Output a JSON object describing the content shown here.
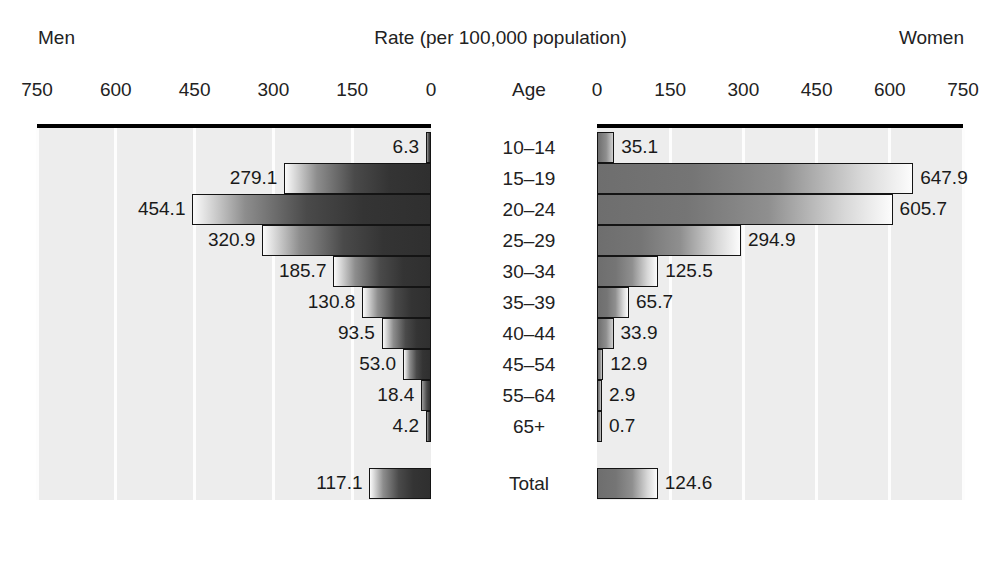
{
  "header": {
    "left_label": "Men",
    "title": "Rate (per 100,000 population)",
    "right_label": "Women",
    "age_column_header": "Age"
  },
  "chart_data": {
    "type": "bar",
    "title": "Rate (per 100,000 population)",
    "subtype": "population-pyramid",
    "xlabel": "Rate (per 100,000 population)",
    "ylabel": "Age",
    "xlim": [
      0,
      750
    ],
    "grid": true,
    "legend_position": "none",
    "categories": [
      "10–14",
      "15–19",
      "20–24",
      "25–29",
      "30–34",
      "35–39",
      "40–44",
      "45–54",
      "55–64",
      "65+",
      "Total"
    ],
    "left_axis_ticks": [
      "750",
      "600",
      "450",
      "300",
      "150",
      "0"
    ],
    "right_axis_ticks": [
      "0",
      "150",
      "300",
      "450",
      "600",
      "750"
    ],
    "tick_values": [
      0,
      150,
      300,
      450,
      600,
      750
    ],
    "series": [
      {
        "name": "Men",
        "side": "left",
        "values": [
          6.3,
          279.1,
          454.1,
          320.9,
          185.7,
          130.8,
          93.5,
          53.0,
          18.4,
          4.2,
          117.1
        ],
        "labels": [
          "6.3",
          "279.1",
          "454.1",
          "320.9",
          "185.7",
          "130.8",
          "93.5",
          "53.0",
          "18.4",
          "4.2",
          "117.1"
        ]
      },
      {
        "name": "Women",
        "side": "right",
        "values": [
          35.1,
          647.9,
          605.7,
          294.9,
          125.5,
          65.7,
          33.9,
          12.9,
          2.9,
          0.7,
          124.6
        ],
        "labels": [
          "35.1",
          "647.9",
          "605.7",
          "294.9",
          "125.5",
          "65.7",
          "33.9",
          "12.9",
          "2.9",
          "0.7",
          "124.6"
        ]
      }
    ]
  },
  "style": {
    "plot_background": "#ededed",
    "gridline_color": "#fdfdfd",
    "axis_color": "#000000",
    "bar_outline": "#141414",
    "text_color": "#1a1a1a"
  }
}
